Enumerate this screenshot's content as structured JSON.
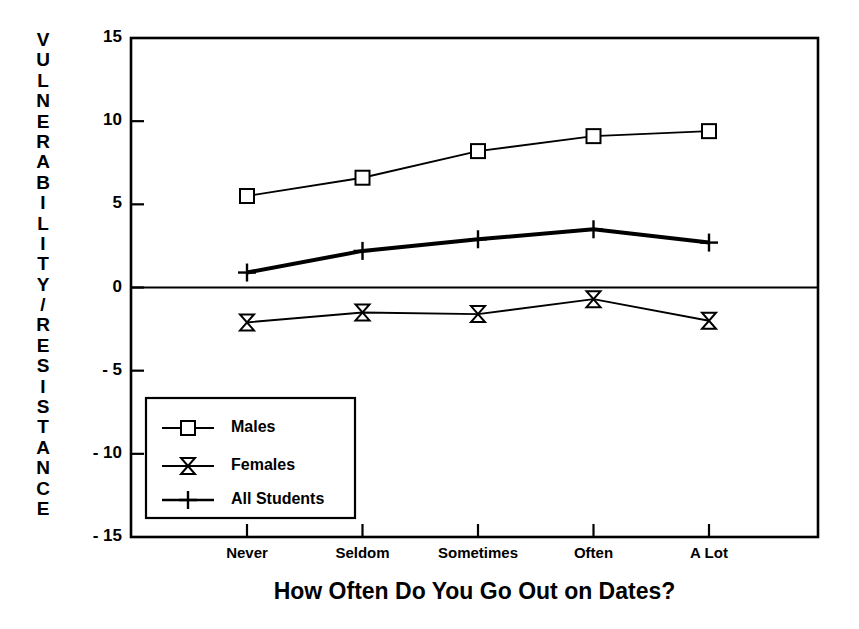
{
  "chart_data": {
    "type": "line",
    "title": "",
    "xlabel": "How Often Do You Go Out on Dates?",
    "ylabel": "VULNERABILITY/RESISTANCE",
    "categories": [
      "Never",
      "Seldom",
      "Sometimes",
      "Often",
      "A Lot"
    ],
    "ylim": [
      -15,
      15
    ],
    "yticks": [
      "15",
      "10",
      "5",
      "0",
      "- 5",
      "- 10",
      "- 15"
    ],
    "ytick_values": [
      15,
      10,
      5,
      0,
      -5,
      -10,
      -15
    ],
    "grid": false,
    "legend_position": "lower-left-inside",
    "series": [
      {
        "name": "Males",
        "marker": "square",
        "values": [
          5.5,
          6.6,
          8.2,
          9.1,
          9.4
        ]
      },
      {
        "name": "Females",
        "marker": "bowtie",
        "values": [
          -2.1,
          -1.5,
          -1.6,
          -0.7,
          -2.0
        ]
      },
      {
        "name": "All Students",
        "marker": "plus",
        "values": [
          0.9,
          2.2,
          2.9,
          3.5,
          2.7
        ]
      }
    ],
    "zero_line": 0,
    "colors": {
      "axis": "#000000",
      "series": "#000000",
      "background": "#ffffff"
    }
  },
  "legend": {
    "items": [
      {
        "label": "Males",
        "marker": "square"
      },
      {
        "label": "Females",
        "marker": "bowtie"
      },
      {
        "label": "All Students",
        "marker": "plus"
      }
    ]
  }
}
